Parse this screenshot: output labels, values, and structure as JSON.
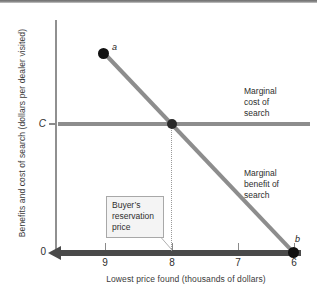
{
  "chart_data": {
    "type": "line",
    "title": "",
    "xlabel": "Lowest price found (thousands of dollars)",
    "ylabel": "Benefits and cost of search (dollars per dealer visited)",
    "xlim": [
      9.5,
      5.8
    ],
    "x_axis_direction": "decreasing-left-to-right",
    "xticks": [
      9,
      8,
      7,
      6
    ],
    "xtick_labels": [
      "9",
      "8",
      "7",
      "6"
    ],
    "yticks": [
      0,
      "C"
    ],
    "ytick_labels": [
      "0",
      "C"
    ],
    "grid": false,
    "legend": "annotations-on-curves",
    "series": [
      {
        "name": "Marginal benefit of search",
        "type": "line",
        "color": "#8d8d8d",
        "x": [
          9.0,
          6.0
        ],
        "y": [
          1.0,
          0.0
        ],
        "endpoints": [
          {
            "label": "a",
            "x": 9.0,
            "y": 1.0,
            "marker": "filled-circle"
          },
          {
            "label": "b",
            "x": 6.0,
            "y": 0.0,
            "marker": "filled-circle"
          }
        ]
      },
      {
        "name": "Marginal cost of search",
        "type": "line",
        "color": "#8d8d8d",
        "x": [
          9.5,
          5.8
        ],
        "y": [
          0.648,
          0.648
        ],
        "level_label": "C"
      }
    ],
    "intersection": {
      "label": "Buyer's reservation price",
      "x": 8.0,
      "y": 0.648,
      "marker": "filled-circle",
      "drop_line": "dotted"
    },
    "annotations": [
      {
        "name": "marginal-cost-annotation",
        "text": "Marginal cost of search"
      },
      {
        "name": "marginal-benefit-annotation",
        "text": "Marginal benefit of search"
      },
      {
        "name": "reservation-price-callout",
        "text": "Buyer's reservation price"
      }
    ]
  },
  "axes": {
    "y_title": "Benefits and cost of search (dollars per dealer visited)",
    "x_title": "Lowest price found (thousands of dollars)",
    "y_labels": {
      "level_c": "C",
      "zero": "0"
    },
    "x_labels": [
      "9",
      "8",
      "7",
      "6"
    ]
  },
  "labels": {
    "point_a": "a",
    "point_b": "b",
    "marginal_cost": {
      "line1": "Marginal",
      "line2": "cost of",
      "line3": "search"
    },
    "marginal_benefit": {
      "line1": "Marginal",
      "line2": "benefit of",
      "line3": "search"
    },
    "callout": {
      "line1": "Buyer’s",
      "line2": "reservation",
      "line3": "price"
    }
  },
  "colors": {
    "curve": "#8d8d8d",
    "x_axis": "#4a4a4a",
    "y_axis": "#909090",
    "point": "#111111",
    "callout_bg": "#f4f4f4",
    "callout_border": "#a8a8a8",
    "text": "#2e2e2e"
  }
}
